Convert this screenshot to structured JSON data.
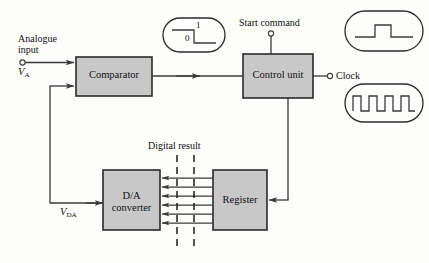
{
  "figure": {
    "background_color": "#fdfdfc",
    "block_fill": "#c8c8c8",
    "block_stroke": "#2b2b2b",
    "line_color": "#3a3a3a",
    "text_color": "#111111"
  },
  "blocks": [
    {
      "id": "comparator",
      "label": "Comparator",
      "x": 76,
      "y": 57,
      "w": 76,
      "h": 39
    },
    {
      "id": "control_unit",
      "label": "Control unit",
      "x": 243,
      "y": 54,
      "w": 70,
      "h": 44
    },
    {
      "id": "da_converter",
      "label_line1": "D/A",
      "label_line2": "converter",
      "x": 103,
      "y": 170,
      "w": 57,
      "h": 60
    },
    {
      "id": "register",
      "label": "Register",
      "x": 213,
      "y": 170,
      "w": 54,
      "h": 60
    }
  ],
  "labels": {
    "analogue_input_line1": "Analogue",
    "analogue_input_line2": "input",
    "v_a_symbol": "V",
    "v_a_subscript": "A",
    "v_da_symbol": "V",
    "v_da_subscript": "DA",
    "start_command": "Start command",
    "clock": "Clock",
    "digital_result": "Digital result"
  },
  "waveform_callouts": [
    {
      "id": "comparator-output-waveform",
      "type": "falling-edge",
      "x": 163,
      "y": 18,
      "w": 62,
      "h": 34,
      "level_high_label": "1",
      "level_low_label": "0"
    },
    {
      "id": "start-command-waveform",
      "type": "single-pulse",
      "x": 345,
      "y": 11,
      "w": 78,
      "h": 40,
      "pulses": 1
    },
    {
      "id": "clock-waveform",
      "type": "periodic-clock",
      "x": 345,
      "y": 84,
      "w": 78,
      "h": 38,
      "pulses": 5
    }
  ],
  "bus": {
    "name": "digital-result-bus",
    "line_count": 6,
    "direction": "register-to-da-converter",
    "dashed_marker_lines": 2
  },
  "terminals": [
    {
      "id": "analogue-input-terminal",
      "shape": "open-circle"
    },
    {
      "id": "start-command-terminal",
      "shape": "open-circle"
    },
    {
      "id": "clock-terminal",
      "shape": "open-circle"
    }
  ]
}
